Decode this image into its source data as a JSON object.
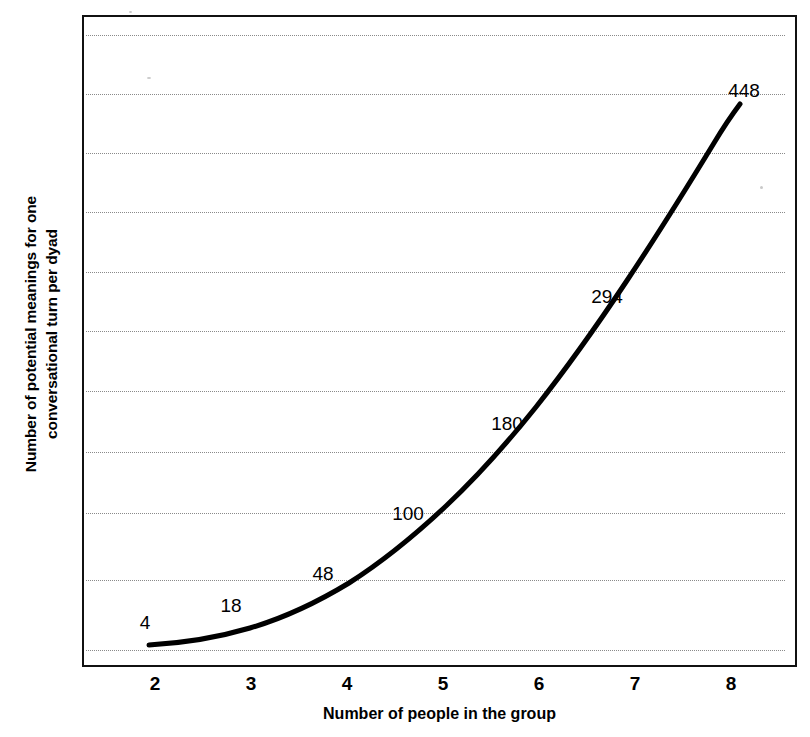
{
  "chart_data": {
    "type": "line",
    "title": "",
    "xlabel": "Number of people in the group",
    "ylabel_lines": [
      "Number of potential meanings for one",
      "conversational turn per dyad"
    ],
    "ylabel": "Number of potential meanings for one conversational turn per dyad",
    "x": [
      2,
      3,
      4,
      5,
      6,
      7,
      8
    ],
    "xticklabels": [
      "2",
      "3",
      "4",
      "5",
      "6",
      "7",
      "8"
    ],
    "values": [
      4,
      18,
      48,
      100,
      180,
      294,
      448
    ],
    "point_labels": [
      "4",
      "18",
      "48",
      "100",
      "180",
      "294",
      "448"
    ],
    "series": [
      {
        "name": "Potential meanings",
        "values": [
          4,
          18,
          48,
          100,
          180,
          294,
          448
        ]
      }
    ],
    "xlim": [
      1.5,
      8.5
    ],
    "ylim": [
      0,
      480
    ],
    "grid": true,
    "grid_orientation": "horizontal",
    "gridline_count": 11,
    "legend": "none",
    "line_color": "#000000",
    "line_width_px": 5,
    "axis_color": "#111111",
    "grid_color": "#8a8a8a",
    "background": "#ffffff"
  },
  "axes": {
    "x_title": "Number of people in the group",
    "y_title_line1": "Number of potential meanings for one",
    "y_title_line2": "conversational turn per dyad"
  },
  "ticks": {
    "x": [
      {
        "label": "2",
        "px": 155
      },
      {
        "label": "3",
        "px": 251
      },
      {
        "label": "4",
        "px": 347
      },
      {
        "label": "5",
        "px": 443
      },
      {
        "label": "6",
        "px": 539
      },
      {
        "label": "7",
        "px": 635
      },
      {
        "label": "8",
        "px": 731
      }
    ]
  },
  "point_labels": [
    {
      "text": "4",
      "x": 143,
      "y": 621
    },
    {
      "text": "18",
      "x": 229,
      "y": 604
    },
    {
      "text": "48",
      "x": 321,
      "y": 572
    },
    {
      "text": "100",
      "x": 406,
      "y": 512
    },
    {
      "text": "180",
      "x": 505,
      "y": 422
    },
    {
      "text": "294",
      "x": 605,
      "y": 295
    },
    {
      "text": "448",
      "x": 742,
      "y": 89
    }
  ],
  "gridlines_y": [
    33,
    92,
    151,
    210,
    270,
    329,
    389,
    450,
    511,
    578,
    648
  ],
  "curve_path": "M 65,628 C 100,626 132,621 166,611 C 200,601 232,586 265,566 C 298,545 330,519 362,489 C 394,459 424,425 452,390 C 482,352 512,310 542,265 C 572,220 602,172 630,126 C 642,106 650,95 656,87"
}
